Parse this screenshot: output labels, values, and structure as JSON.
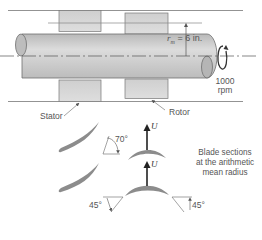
{
  "figure": {
    "type": "axial-flow turbomachine schematic",
    "mean_radius_label": "r",
    "mean_radius_subscript": "m",
    "mean_radius_value": "= 6 in.",
    "speed_value": "1000",
    "speed_unit": "rpm",
    "stator_label": "Stator",
    "rotor_label": "Rotor",
    "caption_lines": [
      "Blade sections",
      "at the arithmetic",
      "mean radius"
    ],
    "blade_speed_symbol": "U",
    "stator_exit_angle": "70°",
    "rotor_inlet_angle": "45°",
    "rotor_exit_angle": "45°"
  },
  "colors": {
    "shaft_fill": "#c9c9c9",
    "shaft_edge": "#6f6f6f",
    "blade_fill": "#8c8c8c",
    "line": "#777777",
    "arrow": "#333333"
  }
}
